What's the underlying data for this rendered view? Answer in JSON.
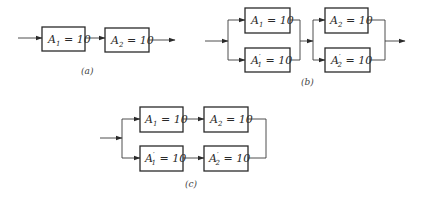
{
  "diagrams": {
    "a": {
      "caption": "(a)",
      "blocks": [
        {
          "sym": "A",
          "prime": "",
          "sub": "1",
          "eq": " = 10"
        },
        {
          "sym": "A",
          "prime": "",
          "sub": "2",
          "eq": " = 10"
        }
      ]
    },
    "b": {
      "caption": "(b)",
      "blocks": [
        {
          "sym": "A",
          "prime": "",
          "sub": "1",
          "eq": " = 10"
        },
        {
          "sym": "A",
          "prime": "′",
          "sub": "1",
          "eq": " = 10"
        },
        {
          "sym": "A",
          "prime": "",
          "sub": "2",
          "eq": " = 10"
        },
        {
          "sym": "A",
          "prime": "′",
          "sub": "2",
          "eq": " = 10"
        }
      ]
    },
    "c": {
      "caption": "(c)",
      "blocks": [
        {
          "sym": "A",
          "prime": "",
          "sub": "1",
          "eq": " = 10"
        },
        {
          "sym": "A",
          "prime": "",
          "sub": "2",
          "eq": " = 10"
        },
        {
          "sym": "A",
          "prime": "′",
          "sub": "1",
          "eq": " = 10"
        },
        {
          "sym": "A",
          "prime": "′",
          "sub": "2",
          "eq": " = 10"
        }
      ]
    }
  }
}
